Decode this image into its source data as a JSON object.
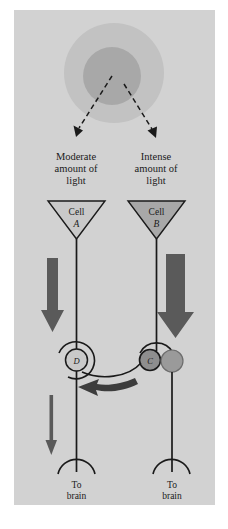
{
  "figure": {
    "panel_background": "#d2d2d2",
    "page_background": "#ffffff",
    "ink_color": "#1a1a1a",
    "arrow_color": "#5a5a5a",
    "stimulus": {
      "name": "light-stimulus",
      "outer_circle_color": "#c2c2c2",
      "inner_circle_color": "#a8a8a8",
      "outer_radius": 50,
      "inner_radius": 29,
      "center_x": 114,
      "center_y": 73
    },
    "dashed_rays": [
      {
        "name": "ray-to-cell-a",
        "x1": 112,
        "y1": 76,
        "x2": 77,
        "y2": 132
      },
      {
        "name": "ray-to-cell-b",
        "x1": 124,
        "y1": 84,
        "x2": 154,
        "y2": 133
      }
    ]
  },
  "left_branch": {
    "stimulus_label_lines": [
      "Moderate",
      "amount of",
      "light"
    ],
    "cell_word": "Cell",
    "cell_id": "A",
    "node_id": "D",
    "output_label_lines": [
      "To",
      "brain"
    ],
    "cell_fill": "#c9c9c9",
    "signal_strength": "moderate",
    "thick_arrow_shaft_width": 11,
    "thin_arrow_present": true
  },
  "right_branch": {
    "stimulus_label_lines": [
      "Intense",
      "amount of",
      "light"
    ],
    "cell_word": "Cell",
    "cell_id": "B",
    "node_id": "C",
    "output_label_lines": [
      "To",
      "brain"
    ],
    "cell_fill": "#a8a8a8",
    "signal_strength": "intense",
    "thick_arrow_shaft_width": 19,
    "thin_arrow_present": false,
    "inhibitory_terminal_fill": "#9a9a9a"
  },
  "inhibition": {
    "name": "lateral-inhibition-arrow",
    "direction": "right-to-left",
    "from_node": "C",
    "to_node": "D",
    "color": "#3d3d3d"
  }
}
